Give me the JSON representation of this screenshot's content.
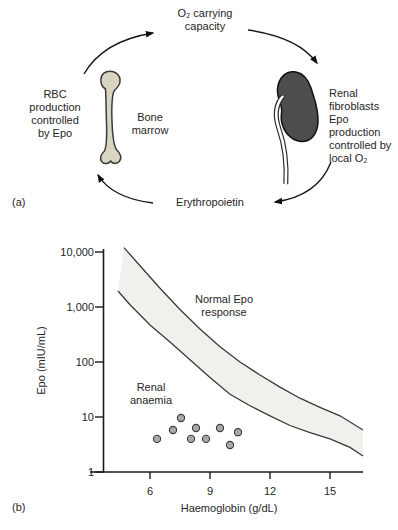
{
  "figure": {
    "panel_a": {
      "label": "(a)",
      "cycle": {
        "top_label": "O₂ carrying\ncapacity",
        "left_label": "RBC\nproduction\ncontrolled\nby Epo",
        "bone_label": "Bone\nmarrow",
        "right_label": "Renal fibroblasts\nEpo production\ncontrolled by\nlocal O₂",
        "bottom_label": "Erythropoietin"
      },
      "icons": {
        "bone": "bone-icon",
        "kidney": "kidney-icon",
        "arrows": [
          "cycle-arrow-top-left",
          "cycle-arrow-top-right",
          "cycle-arrow-bottom-right",
          "cycle-arrow-bottom-left"
        ]
      },
      "colors": {
        "bone_fill": "#d8d5c2",
        "kidney_fill": "#4d4d4d",
        "line": "#1c1c1c"
      }
    },
    "panel_b": {
      "label": "(b)"
    }
  },
  "chart_data": {
    "type": "scatter",
    "title": "",
    "xlabel": "Haemoglobin (g/dL)",
    "ylabel": "Epo (mIU/mL)",
    "y_scale": "log",
    "xlim": [
      3.7,
      16.65
    ],
    "ylim": [
      1,
      10000
    ],
    "grid": false,
    "x_ticks": [
      6,
      9,
      12,
      15
    ],
    "y_ticks": [
      1,
      10,
      100,
      1000,
      10000
    ],
    "y_tick_labels": [
      "1",
      "10",
      "100",
      "1,000",
      "10,000"
    ],
    "band": {
      "label": "Normal Epo\nresponse",
      "fill": "#f1f0ec",
      "stroke": "#3a3a3a",
      "upper": [
        [
          4.7,
          12000
        ],
        [
          5.5,
          5600
        ],
        [
          6.5,
          2200
        ],
        [
          7.5,
          900
        ],
        [
          8.5,
          400
        ],
        [
          9.5,
          190
        ],
        [
          10.5,
          100
        ],
        [
          11.5,
          58
        ],
        [
          12.5,
          35
        ],
        [
          13.5,
          22
        ],
        [
          14.5,
          15
        ],
        [
          15.5,
          10.5
        ],
        [
          16.65,
          5.8
        ]
      ],
      "lower": [
        [
          4.4,
          1950
        ],
        [
          5,
          1100
        ],
        [
          6,
          470
        ],
        [
          7,
          230
        ],
        [
          8,
          110
        ],
        [
          9,
          52
        ],
        [
          10,
          26
        ],
        [
          11,
          16
        ],
        [
          12,
          10.5
        ],
        [
          13,
          7
        ],
        [
          14,
          5.2
        ],
        [
          15,
          4.0
        ],
        [
          16,
          2.8
        ],
        [
          16.65,
          1.95
        ]
      ]
    },
    "scatter": {
      "label": "Renal\nanaemia",
      "point_fill": "#a9a9a9",
      "point_stroke": "#3a3a3a",
      "points": [
        [
          6.35,
          4.0
        ],
        [
          7.15,
          5.8
        ],
        [
          7.55,
          9.6
        ],
        [
          8.05,
          4.0
        ],
        [
          8.3,
          6.3
        ],
        [
          8.8,
          4.0
        ],
        [
          9.5,
          6.3
        ],
        [
          10.0,
          3.1
        ],
        [
          10.4,
          5.3
        ]
      ]
    }
  }
}
